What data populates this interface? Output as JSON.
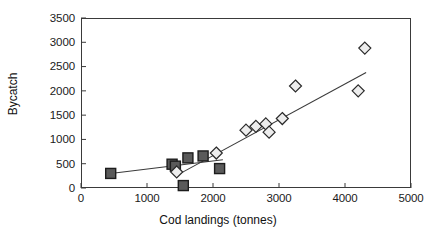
{
  "chart_data": {
    "type": "scatter",
    "title": "",
    "xlabel": "Cod landings (tonnes)",
    "ylabel": "Bycatch",
    "xlim": [
      0,
      5000
    ],
    "ylim": [
      0,
      3500
    ],
    "xticks": [
      0,
      1000,
      2000,
      3000,
      4000,
      5000
    ],
    "yticks": [
      0,
      500,
      1000,
      1500,
      2000,
      2500,
      3000,
      3500
    ],
    "xtick_labels": [
      "0",
      "1000",
      "2000",
      "3000",
      "4000",
      "5000"
    ],
    "ytick_labels": [
      "0",
      "500",
      "1000",
      "1500",
      "2000",
      "2500",
      "3000",
      "3500"
    ],
    "grid": false,
    "legend": "none",
    "series": [
      {
        "name": "filled-squares",
        "marker": "square",
        "fill": "#5a5a5a",
        "edge": "#1c1c1c",
        "points": [
          {
            "x": 450,
            "y": 300
          },
          {
            "x": 1380,
            "y": 490
          },
          {
            "x": 1430,
            "y": 450
          },
          {
            "x": 1550,
            "y": 50
          },
          {
            "x": 1620,
            "y": 620
          },
          {
            "x": 1850,
            "y": 660
          },
          {
            "x": 2100,
            "y": 400
          }
        ]
      },
      {
        "name": "open-diamonds",
        "marker": "diamond",
        "fill": "#ededed",
        "edge": "#2a2a2a",
        "points": [
          {
            "x": 1450,
            "y": 330
          },
          {
            "x": 2050,
            "y": 720
          },
          {
            "x": 2500,
            "y": 1190
          },
          {
            "x": 2650,
            "y": 1270
          },
          {
            "x": 2800,
            "y": 1320
          },
          {
            "x": 2850,
            "y": 1150
          },
          {
            "x": 3050,
            "y": 1430
          },
          {
            "x": 3250,
            "y": 2100
          },
          {
            "x": 4200,
            "y": 2000
          },
          {
            "x": 4300,
            "y": 2880
          }
        ]
      }
    ],
    "trend_lines": [
      {
        "name": "squares-trend",
        "x0": 450,
        "y0": 300,
        "x1": 2150,
        "y1": 580,
        "color": "#3a3a3a"
      },
      {
        "name": "diamonds-trend",
        "x0": 1450,
        "y0": 260,
        "x1": 4320,
        "y1": 2380,
        "color": "#3a3a3a"
      }
    ]
  },
  "axes": {
    "x_title": "Cod landings (tonnes)",
    "y_title": "Bycatch"
  }
}
